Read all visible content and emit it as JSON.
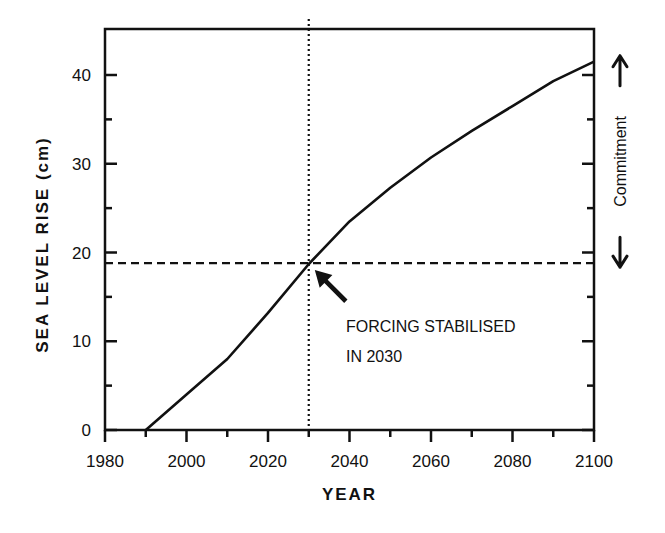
{
  "chart_data": {
    "type": "line",
    "title": "",
    "xlabel": "YEAR",
    "ylabel": "SEA LEVEL RISE (cm)",
    "xlim": [
      1980,
      2100
    ],
    "ylim": [
      0,
      45
    ],
    "x_ticks": [
      1980,
      2000,
      2020,
      2040,
      2060,
      2080,
      2100
    ],
    "x_tick_labels": [
      "1980",
      "2000",
      "2020",
      "2040",
      "2060",
      "2080",
      "2100"
    ],
    "x_minor_step": 10,
    "y_ticks": [
      0,
      10,
      20,
      30,
      40
    ],
    "y_tick_labels": [
      "0",
      "10",
      "20",
      "30",
      "40"
    ],
    "y_minor_step": 5,
    "grid": false,
    "series": [
      {
        "name": "Sea level rise",
        "style": "solid",
        "x": [
          1990,
          2000,
          2010,
          2020,
          2030,
          2040,
          2050,
          2060,
          2070,
          2080,
          2090,
          2100
        ],
        "y": [
          0,
          4,
          8,
          13.2,
          18.7,
          23.5,
          27.3,
          30.7,
          33.7,
          36.5,
          39.3,
          41.5
        ]
      }
    ],
    "reference_lines": [
      {
        "name": "forcing-stabilised-year",
        "orientation": "vertical",
        "style": "dotted",
        "value": 2030
      },
      {
        "name": "level-at-stabilisation",
        "orientation": "horizontal",
        "style": "dashed",
        "value": 18.8
      }
    ],
    "annotations": [
      {
        "name": "forcing-annotation",
        "lines": [
          "FORCING STABILISED",
          "IN 2030"
        ],
        "points_to": [
          2030,
          18.8
        ]
      },
      {
        "name": "commitment-annotation",
        "text": "Commitment",
        "spans_y": [
          18.8,
          41.5
        ],
        "placement": "right"
      }
    ]
  }
}
